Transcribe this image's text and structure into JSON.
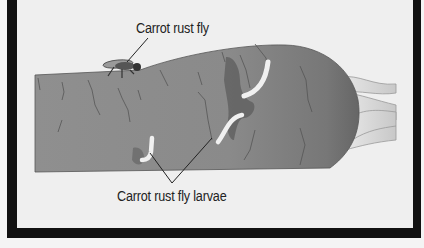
{
  "diagram": {
    "labels": {
      "fly": "Carrot rust fly",
      "larvae": "Carrot rust fly larvae"
    },
    "subjects": [
      "carrot",
      "carrot rust fly",
      "larvae tunnels",
      "carrot tops"
    ],
    "colors": {
      "frame": "#111111",
      "background": "#efefef",
      "carrot_light": "#9a9a9a",
      "carrot_dark": "#6e6e6e",
      "tunnel": "#555555",
      "larva": "#f2f2f2",
      "leaves": "#d6d6d6"
    }
  }
}
